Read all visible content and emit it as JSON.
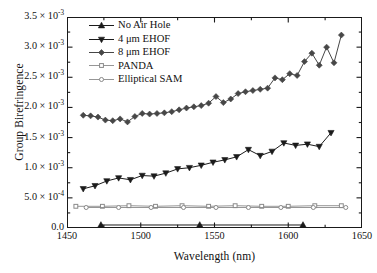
{
  "chart_data": {
    "type": "line",
    "title": "",
    "xlabel": "Wavelength (nm)",
    "ylabel": "Group Birefringence",
    "xlim": [
      1450,
      1650
    ],
    "ylim": [
      0.0,
      0.0035
    ],
    "grid": false,
    "legend_position": "top-left-inside",
    "xticks": [
      1450,
      1500,
      1550,
      1600,
      1650
    ],
    "xticklabels": [
      "1450",
      "1500",
      "1550",
      "1600",
      "1650"
    ],
    "yticks": [
      0.0,
      0.0005,
      0.001,
      0.0015,
      0.002,
      0.0025,
      0.003,
      0.0035
    ],
    "yticklabels": [
      {
        "mant": "0.0",
        "exp": ""
      },
      {
        "mant": "5.0 × 10",
        "exp": "-4"
      },
      {
        "mant": "1.0 × 10",
        "exp": "-3"
      },
      {
        "mant": "1.5 × 10",
        "exp": "-3"
      },
      {
        "mant": "2.0 × 10",
        "exp": "-3"
      },
      {
        "mant": "2.5 × 10",
        "exp": "-3"
      },
      {
        "mant": "3.0 × 10",
        "exp": "-3"
      },
      {
        "mant": "3.5 × 10",
        "exp": "-3"
      }
    ],
    "minor_ticks_y": true,
    "minor_ticks_x": true,
    "series": [
      {
        "name": "No Air Hole",
        "marker": "triangle-up",
        "filled": true,
        "color": "#1b1b1b",
        "x": [
          1473,
          1540,
          1610
        ],
        "values": [
          5e-05,
          5e-05,
          5e-05
        ]
      },
      {
        "name": "4 μm EHOF",
        "marker": "triangle-down",
        "filled": true,
        "color": "#1b1b1b",
        "x": [
          1461,
          1469,
          1477,
          1485,
          1493,
          1501,
          1509,
          1517,
          1525,
          1533,
          1541,
          1549,
          1557,
          1565,
          1573,
          1581,
          1589,
          1597,
          1605,
          1613,
          1621,
          1629
        ],
        "values": [
          0.00065,
          0.0007,
          0.00078,
          0.00083,
          0.0008,
          0.00087,
          0.00086,
          0.00091,
          0.00098,
          0.001,
          0.00104,
          0.00109,
          0.00113,
          0.00118,
          0.0013,
          0.0012,
          0.00127,
          0.00141,
          0.00137,
          0.00139,
          0.00135,
          0.00158
        ]
      },
      {
        "name": "8 μm EHOF",
        "marker": "diamond",
        "filled": true,
        "color": "#474747",
        "x": [
          1461,
          1466,
          1471,
          1476,
          1481,
          1486,
          1491,
          1496,
          1501,
          1506,
          1511,
          1516,
          1521,
          1526,
          1531,
          1536,
          1541,
          1546,
          1551,
          1556,
          1561,
          1566,
          1571,
          1576,
          1581,
          1586,
          1591,
          1596,
          1601,
          1606,
          1611,
          1616,
          1621,
          1626,
          1631,
          1636
        ],
        "values": [
          0.00187,
          0.00186,
          0.00184,
          0.00179,
          0.00178,
          0.00181,
          0.00176,
          0.00185,
          0.0019,
          0.00189,
          0.0019,
          0.00191,
          0.00193,
          0.00196,
          0.00199,
          0.00201,
          0.00203,
          0.00207,
          0.00218,
          0.00208,
          0.00214,
          0.00223,
          0.00226,
          0.00228,
          0.0023,
          0.00232,
          0.00249,
          0.00246,
          0.00256,
          0.00253,
          0.00276,
          0.0029,
          0.0027,
          0.003,
          0.00274,
          0.0032
        ]
      },
      {
        "name": "PANDA",
        "marker": "square",
        "filled": false,
        "color": "#8a8a8a",
        "x": [
          1456,
          1474,
          1492,
          1510,
          1528,
          1546,
          1564,
          1582,
          1600,
          1618,
          1636
        ],
        "values": [
          0.00036,
          0.00036,
          0.00037,
          0.00036,
          0.00037,
          0.00036,
          0.00037,
          0.00036,
          0.00036,
          0.00037,
          0.00037
        ]
      },
      {
        "name": "Elliptical SAM",
        "marker": "circle",
        "filled": false,
        "color": "#8a8a8a",
        "x": [
          1463,
          1485,
          1507,
          1529,
          1551,
          1573,
          1595,
          1617,
          1639
        ],
        "values": [
          0.00034,
          0.00034,
          0.00034,
          0.00034,
          0.00034,
          0.00034,
          0.00034,
          0.00034,
          0.00034
        ]
      }
    ]
  }
}
